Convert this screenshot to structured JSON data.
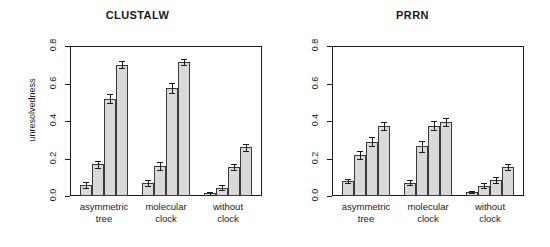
{
  "figure": {
    "width": 550,
    "height": 247,
    "background": "#ffffff",
    "bar_fill": "#d9d9d9",
    "bar_stroke": "#3a3a3a",
    "axis_color": "#1a1a1a"
  },
  "panels": [
    {
      "id": "clustalw",
      "title": "CLUSTALW",
      "ylabel": "unresolvedness"
    },
    {
      "id": "prrn",
      "title": "PRRN",
      "ylabel": ""
    }
  ],
  "axis": {
    "ytick_labels": [
      "0.0",
      "0.2",
      "0.4",
      "0.6",
      "0.8"
    ],
    "ytick_values": [
      0.0,
      0.2,
      0.4,
      0.6,
      0.8
    ],
    "ymin": 0.0,
    "ymax": 0.8,
    "xgroups": [
      {
        "line1": "asymmetric",
        "line2": "tree"
      },
      {
        "line1": "molecular",
        "line2": "clock"
      },
      {
        "line1": "without",
        "line2": "clock"
      }
    ]
  },
  "chart_data": [
    {
      "type": "bar",
      "title": "CLUSTALW",
      "xlabel": "",
      "ylabel": "unresolvedness",
      "ylim": [
        0.0,
        0.8
      ],
      "yticks": [
        0.0,
        0.2,
        0.4,
        0.6,
        0.8
      ],
      "grid": false,
      "legend": "none",
      "categories": [
        "asymmetric tree",
        "molecular clock",
        "without clock"
      ],
      "bars_per_category": 4,
      "groups": [
        {
          "category": "asymmetric tree",
          "values": [
            0.06,
            0.17,
            0.52,
            0.7
          ],
          "errors": [
            0.015,
            0.018,
            0.025,
            0.018
          ]
        },
        {
          "category": "molecular clock",
          "values": [
            0.07,
            0.16,
            0.575,
            0.715
          ],
          "errors": [
            0.015,
            0.022,
            0.028,
            0.018
          ]
        },
        {
          "category": "without clock",
          "values": [
            0.015,
            0.045,
            0.155,
            0.26
          ],
          "errors": [
            0.008,
            0.012,
            0.018,
            0.02
          ]
        }
      ]
    },
    {
      "type": "bar",
      "title": "PRRN",
      "xlabel": "",
      "ylabel": "",
      "ylim": [
        0.0,
        0.8
      ],
      "yticks": [
        0.0,
        0.2,
        0.4,
        0.6,
        0.8
      ],
      "grid": false,
      "legend": "none",
      "categories": [
        "asymmetric tree",
        "molecular clock",
        "without clock"
      ],
      "bars_per_category": 4,
      "groups": [
        {
          "category": "asymmetric tree",
          "values": [
            0.08,
            0.22,
            0.29,
            0.375
          ],
          "errors": [
            0.012,
            0.022,
            0.025,
            0.022
          ]
        },
        {
          "category": "molecular clock",
          "values": [
            0.07,
            0.265,
            0.375,
            0.395
          ],
          "errors": [
            0.013,
            0.03,
            0.025,
            0.022
          ]
        },
        {
          "category": "without clock",
          "values": [
            0.02,
            0.055,
            0.085,
            0.155
          ],
          "errors": [
            0.006,
            0.012,
            0.015,
            0.018
          ]
        }
      ]
    }
  ]
}
